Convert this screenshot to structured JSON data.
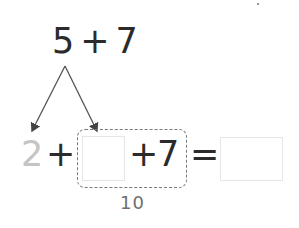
{
  "problem": {
    "top_expression": {
      "left": "5",
      "operator": "+",
      "right": "7"
    },
    "decomposition": {
      "part_given": "2",
      "part_blank": ""
    },
    "equation": {
      "first_term": "2",
      "plus_1": "+",
      "blank_term": "",
      "plus_2": "+",
      "second_term": "7",
      "equals": "=",
      "answer": ""
    },
    "grouped_sum_label": "10"
  },
  "colors": {
    "ink": "#2b2b2b",
    "faded_digit": "#c4c4c4",
    "dashed_group": "#7a7a7a",
    "answer_box_border": "#e6e6e6"
  }
}
